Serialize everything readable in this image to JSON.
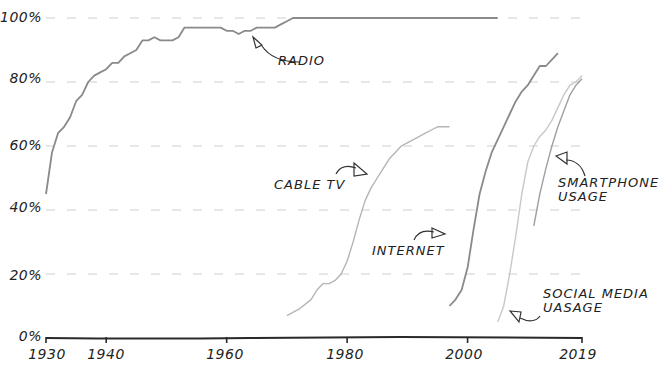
{
  "chart_data": {
    "type": "line",
    "title": "",
    "xlabel": "",
    "ylabel": "",
    "xlim": [
      1930,
      2019
    ],
    "ylim": [
      0,
      100
    ],
    "grid": "horizontal dashed",
    "legend": "inline annotations with arrows",
    "x_ticks": [
      "1930",
      "1940",
      "1960",
      "1980",
      "2000",
      "2019"
    ],
    "y_ticks": [
      "0%",
      "20%",
      "40%",
      "60%",
      "80%",
      "100%"
    ],
    "series": [
      {
        "name": "RADIO",
        "color": "#8a8a8a",
        "points": [
          [
            1930,
            45
          ],
          [
            1931,
            58
          ],
          [
            1932,
            64
          ],
          [
            1933,
            66
          ],
          [
            1934,
            69
          ],
          [
            1935,
            74
          ],
          [
            1936,
            76
          ],
          [
            1937,
            80
          ],
          [
            1938,
            82
          ],
          [
            1939,
            83
          ],
          [
            1940,
            84
          ],
          [
            1941,
            86
          ],
          [
            1942,
            86
          ],
          [
            1943,
            88
          ],
          [
            1944,
            89
          ],
          [
            1945,
            90
          ],
          [
            1946,
            93
          ],
          [
            1947,
            93
          ],
          [
            1948,
            94
          ],
          [
            1949,
            93
          ],
          [
            1950,
            93
          ],
          [
            1951,
            93
          ],
          [
            1952,
            94
          ],
          [
            1953,
            97
          ],
          [
            1954,
            97
          ],
          [
            1955,
            97
          ],
          [
            1956,
            97
          ],
          [
            1957,
            97
          ],
          [
            1958,
            97
          ],
          [
            1959,
            97
          ],
          [
            1960,
            96
          ],
          [
            1961,
            96
          ],
          [
            1962,
            95
          ],
          [
            1963,
            96
          ],
          [
            1964,
            96
          ],
          [
            1965,
            97
          ],
          [
            1966,
            97
          ],
          [
            1967,
            97
          ],
          [
            1968,
            97
          ],
          [
            1969,
            98
          ],
          [
            1970,
            99
          ],
          [
            1971,
            100
          ],
          [
            1975,
            100
          ],
          [
            1980,
            100
          ],
          [
            1990,
            100
          ],
          [
            2000,
            100
          ],
          [
            2005,
            100
          ]
        ]
      },
      {
        "name": "CABLE TV",
        "color": "#b5b5b5",
        "points": [
          [
            1970,
            7
          ],
          [
            1972,
            9
          ],
          [
            1974,
            12
          ],
          [
            1975,
            15
          ],
          [
            1976,
            17
          ],
          [
            1977,
            17
          ],
          [
            1978,
            18
          ],
          [
            1979,
            20
          ],
          [
            1980,
            24
          ],
          [
            1981,
            30
          ],
          [
            1982,
            37
          ],
          [
            1983,
            43
          ],
          [
            1984,
            47
          ],
          [
            1985,
            50
          ],
          [
            1986,
            53
          ],
          [
            1987,
            56
          ],
          [
            1988,
            58
          ],
          [
            1989,
            60
          ],
          [
            1990,
            61
          ],
          [
            1991,
            62
          ],
          [
            1992,
            63
          ],
          [
            1993,
            64
          ],
          [
            1994,
            65
          ],
          [
            1995,
            66
          ],
          [
            1996,
            66
          ],
          [
            1997,
            66
          ]
        ]
      },
      {
        "name": "INTERNET",
        "color": "#8a8a8a",
        "points": [
          [
            1997,
            10
          ],
          [
            1998,
            12
          ],
          [
            1999,
            15
          ],
          [
            2000,
            22
          ],
          [
            2001,
            34
          ],
          [
            2002,
            45
          ],
          [
            2003,
            52
          ],
          [
            2004,
            58
          ],
          [
            2005,
            62
          ],
          [
            2006,
            66
          ],
          [
            2007,
            70
          ],
          [
            2008,
            74
          ],
          [
            2009,
            77
          ],
          [
            2010,
            79
          ],
          [
            2011,
            82
          ],
          [
            2012,
            85
          ],
          [
            2013,
            85
          ],
          [
            2014,
            87
          ],
          [
            2015,
            89
          ]
        ]
      },
      {
        "name": "SMARTPHONE USAGE",
        "color": "#a0a0a0",
        "points": [
          [
            2011,
            35
          ],
          [
            2012,
            45
          ],
          [
            2013,
            53
          ],
          [
            2014,
            60
          ],
          [
            2015,
            66
          ],
          [
            2016,
            71
          ],
          [
            2017,
            76
          ],
          [
            2018,
            79
          ],
          [
            2019,
            81
          ]
        ]
      },
      {
        "name": "SOCIAL MEDIA UASAGE",
        "color": "#c8c8c8",
        "points": [
          [
            2005,
            5
          ],
          [
            2006,
            10
          ],
          [
            2007,
            20
          ],
          [
            2008,
            32
          ],
          [
            2009,
            45
          ],
          [
            2010,
            55
          ],
          [
            2011,
            60
          ],
          [
            2012,
            63
          ],
          [
            2013,
            65
          ],
          [
            2014,
            68
          ],
          [
            2015,
            72
          ],
          [
            2016,
            76
          ],
          [
            2017,
            79
          ],
          [
            2018,
            80
          ],
          [
            2019,
            82
          ]
        ]
      }
    ],
    "annotations": [
      "RADIO",
      "CABLE TV",
      "INTERNET",
      "SMARTPHONE USAGE",
      "SOCIAL MEDIA UASAGE"
    ]
  },
  "labels": {
    "y": [
      "0%",
      "20%",
      "40%",
      "60%",
      "80%",
      "100%"
    ],
    "x": [
      "1930",
      "1940",
      "1960",
      "1980",
      "2000",
      "2019"
    ],
    "radio": "RADIO",
    "cable": "CABLE TV",
    "internet": "INTERNET",
    "smartphone_1": "SMARTPHONE",
    "smartphone_2": "USAGE",
    "social_1": "SOCIAL MEDIA",
    "social_2": "UASAGE"
  }
}
